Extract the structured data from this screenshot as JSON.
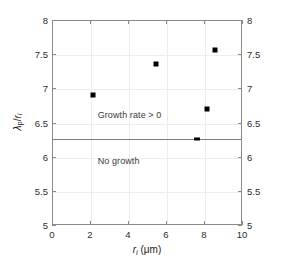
{
  "chart_data": {
    "type": "scatter",
    "title": "",
    "xlabel": "r_i (μm)",
    "ylabel": "λ_p/r_i",
    "xlim": [
      0,
      10
    ],
    "ylim": [
      5,
      8
    ],
    "grid": true,
    "legend": null,
    "x_ticks": [
      0,
      2,
      4,
      6,
      8,
      10
    ],
    "x_ticklabels": [
      "0",
      "2",
      "4",
      "6",
      "8",
      "10"
    ],
    "y_ticks": [
      5,
      5.5,
      6,
      6.5,
      7,
      7.5,
      8
    ],
    "y_ticklabels": [
      "5",
      "5.5",
      "6",
      "6.5",
      "7",
      "7.5",
      "8"
    ],
    "y_ticks_right": [
      5,
      5.5,
      6,
      6.5,
      7,
      7.5,
      8
    ],
    "y_ticklabels_right": [
      "5",
      "5.5",
      "6",
      "6.5",
      "7",
      "7.5",
      "8"
    ],
    "series": [
      {
        "name": "measurements",
        "marker": "square",
        "color": "#000000",
        "points": [
          {
            "x": 2.1,
            "y": 6.92
          },
          {
            "x": 5.4,
            "y": 7.37
          },
          {
            "x": 7.6,
            "y": 6.27
          },
          {
            "x": 8.1,
            "y": 6.71
          },
          {
            "x": 8.5,
            "y": 7.57
          }
        ]
      }
    ],
    "threshold_line": {
      "name": "growth-threshold",
      "y": 6.27,
      "color": "#7d7d7d",
      "orientation": "horizontal"
    },
    "annotations": [
      {
        "name": "growth-positive-label",
        "text": "Growth rate > 0",
        "x": 2.35,
        "y": 6.62
      },
      {
        "name": "no-growth-label",
        "text": "No growth",
        "x": 2.35,
        "y": 5.95
      }
    ]
  },
  "axis_titles": {
    "x_symbol": "r",
    "x_subscript": "i",
    "x_units": " (μm)",
    "y_numerator_symbol": "λ",
    "y_numerator_subscript": "p",
    "y_divider": "/",
    "y_denominator_symbol": "r",
    "y_denominator_subscript": "i"
  }
}
